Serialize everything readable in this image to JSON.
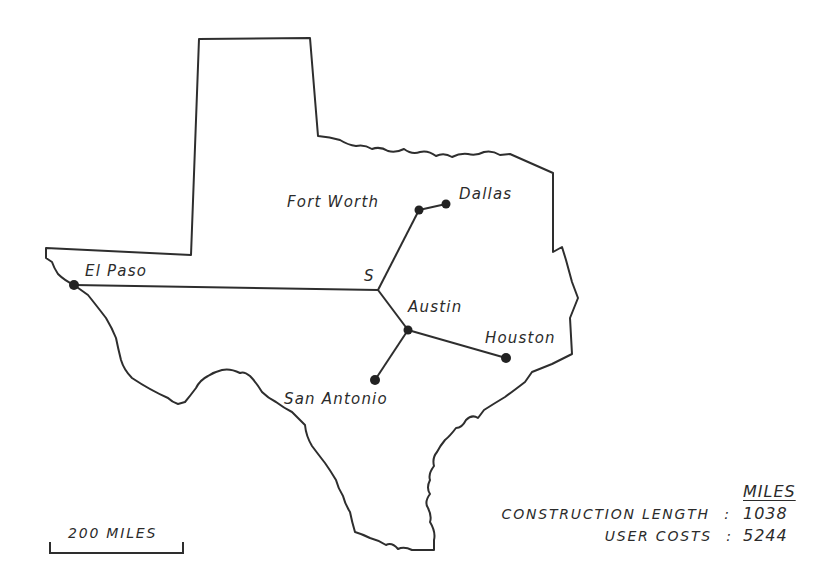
{
  "map": {
    "region": "Texas",
    "colors": {
      "line": "#2e2e2e",
      "background": "#ffffff"
    },
    "cities": [
      {
        "name": "El Paso",
        "x": 74,
        "y": 285
      },
      {
        "name": "Fort Worth",
        "x": 419,
        "y": 210
      },
      {
        "name": "Dallas",
        "x": 446,
        "y": 204
      },
      {
        "name": "Austin",
        "x": 408,
        "y": 330
      },
      {
        "name": "Houston",
        "x": 506,
        "y": 358
      },
      {
        "name": "San Antonio",
        "x": 375,
        "y": 380
      }
    ],
    "steiner_point": {
      "label": "S",
      "x": 378,
      "y": 290
    },
    "labels": {
      "el_paso": "El Paso",
      "fort_worth": "Fort Worth",
      "dallas": "Dallas",
      "steiner": "S",
      "austin": "Austin",
      "houston": "Houston",
      "san_antonio": "San Antonio"
    },
    "scale_bar": {
      "label": "200 MILES"
    }
  },
  "legend": {
    "header": "MILES",
    "rows": [
      {
        "label": "CONSTRUCTION LENGTH",
        "separator": ":",
        "value": "1038"
      },
      {
        "label": "USER COSTS",
        "separator": ":",
        "value": "5244"
      }
    ]
  }
}
